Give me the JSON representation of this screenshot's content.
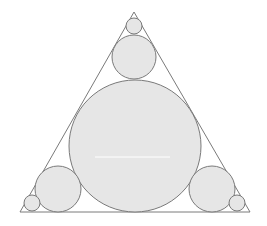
{
  "diagram": {
    "title": "",
    "background": "#ffffff",
    "stroke_color": "#7a7a7a",
    "fill_color": "#e6e6e6",
    "triangle": {
      "points": [
        [
          134,
          12
        ],
        [
          20,
          212
        ],
        [
          250,
          212
        ]
      ]
    },
    "circles": [
      {
        "name": "large-center",
        "cx": 135,
        "cy": 146,
        "r": 66
      },
      {
        "name": "top-medium",
        "cx": 134,
        "cy": 57,
        "r": 22
      },
      {
        "name": "top-small",
        "cx": 134,
        "cy": 26,
        "r": 8
      },
      {
        "name": "bottom-left-medium",
        "cx": 58,
        "cy": 189,
        "r": 23
      },
      {
        "name": "bottom-left-small",
        "cx": 32,
        "cy": 203,
        "r": 8
      },
      {
        "name": "bottom-right-medium",
        "cx": 212,
        "cy": 189,
        "r": 23
      },
      {
        "name": "bottom-right-small",
        "cx": 237,
        "cy": 203,
        "r": 8
      }
    ],
    "artifact_line": {
      "x1": 95,
      "y1": 157,
      "x2": 170,
      "y2": 157,
      "color": "#ffffff"
    }
  }
}
